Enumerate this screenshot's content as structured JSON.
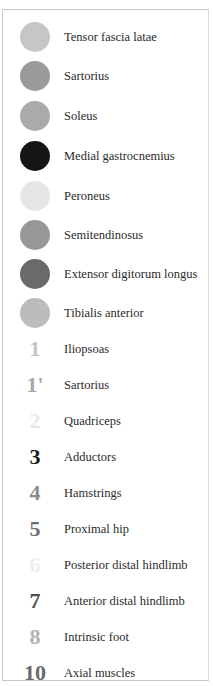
{
  "legend": {
    "colored_items": [
      {
        "label": "Tensor fascia latae",
        "color": "#c6c6c6"
      },
      {
        "label": "Sartorius",
        "color": "#9a9a9a"
      },
      {
        "label": "Soleus",
        "color": "#aaaaaa"
      },
      {
        "label": "Medial gastrocnemius",
        "color": "#151515"
      },
      {
        "label": "Peroneus",
        "color": "#e6e6e6"
      },
      {
        "label": "Semitendinosus",
        "color": "#979797"
      },
      {
        "label": "Extensor digitorum longus",
        "color": "#6a6a6a"
      },
      {
        "label": "Tibialis anterior",
        "color": "#bcbcbc"
      }
    ],
    "numbered_items": [
      {
        "number": "1",
        "label": "Iliopsoas",
        "color": "#c4c4c4"
      },
      {
        "number": "1'",
        "label": "Sartorius",
        "color": "#a8a8a8"
      },
      {
        "number": "2",
        "label": "Quadriceps",
        "color": "#e8e8e8"
      },
      {
        "number": "3",
        "label": "Adductors",
        "color": "#1c1c1c"
      },
      {
        "number": "4",
        "label": "Hamstrings",
        "color": "#8c8c8c"
      },
      {
        "number": "5",
        "label": "Proximal hip",
        "color": "#6e6e6e"
      },
      {
        "number": "6",
        "label": "Posterior distal hindlimb",
        "color": "#eeeeee"
      },
      {
        "number": "7",
        "label": "Anterior distal hindlimb",
        "color": "#505050"
      },
      {
        "number": "8",
        "label": "Intrinsic foot",
        "color": "#b4b4b4"
      },
      {
        "number": "10",
        "label": "Axial muscles",
        "color": "#6a6a6a"
      }
    ]
  }
}
